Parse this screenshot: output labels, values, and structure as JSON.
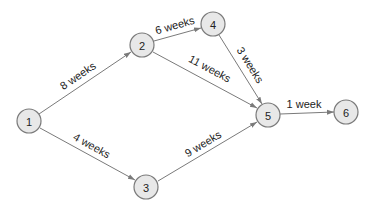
{
  "diagram": {
    "type": "project-network",
    "colors": {
      "node_fill": "#e8e8e8",
      "node_stroke": "#7a7a7a",
      "edge": "#7a7a7a",
      "text": "#222222"
    },
    "nodes": [
      {
        "id": "1",
        "label": "1",
        "x": 29,
        "y": 121
      },
      {
        "id": "2",
        "label": "2",
        "x": 142,
        "y": 45
      },
      {
        "id": "3",
        "label": "3",
        "x": 146,
        "y": 187
      },
      {
        "id": "4",
        "label": "4",
        "x": 213,
        "y": 24
      },
      {
        "id": "5",
        "label": "5",
        "x": 268,
        "y": 115
      },
      {
        "id": "6",
        "label": "6",
        "x": 346,
        "y": 112
      }
    ],
    "edges": [
      {
        "from": "1",
        "to": "2",
        "label": "8 weeks"
      },
      {
        "from": "1",
        "to": "3",
        "label": "4 weeks"
      },
      {
        "from": "2",
        "to": "4",
        "label": "6 weeks"
      },
      {
        "from": "2",
        "to": "5",
        "label": "11 weeks"
      },
      {
        "from": "4",
        "to": "5",
        "label": "3 weeks"
      },
      {
        "from": "3",
        "to": "5",
        "label": "9 weeks"
      },
      {
        "from": "5",
        "to": "6",
        "label": "1 week"
      }
    ]
  }
}
